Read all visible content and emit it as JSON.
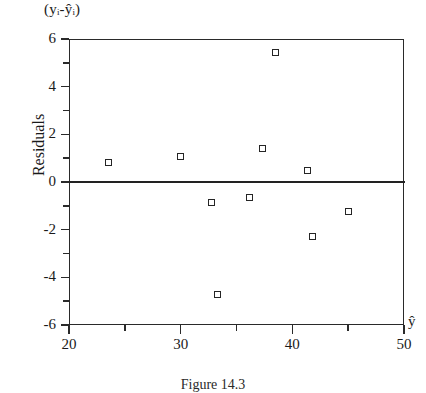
{
  "chart_data": {
    "type": "scatter",
    "title": "",
    "caption": "Figure 14.3",
    "ylabel": "Residuals",
    "y_axis_note": "(yᵢ-ŷᵢ)",
    "xlabel": "ŷ",
    "xlim": [
      20,
      50
    ],
    "ylim": [
      -6,
      6
    ],
    "grid": false,
    "legend": "none",
    "zero_reference_line": 0,
    "x_ticks_major": [
      20,
      30,
      40,
      50
    ],
    "x_ticks_minor": [
      25,
      35,
      45
    ],
    "y_ticks_major": [
      6,
      4,
      2,
      0,
      -2,
      -4,
      -6
    ],
    "y_ticks_minor": [
      5,
      3,
      1,
      -1,
      -3,
      -5
    ],
    "x_tick_labels": [
      "20",
      "30",
      "40",
      "50"
    ],
    "y_tick_labels": [
      "6",
      "4",
      "2",
      "0",
      "-2",
      "-4",
      "-6"
    ],
    "marker": "open-square",
    "points": [
      {
        "x": 23.5,
        "y": 0.8
      },
      {
        "x": 30.0,
        "y": 1.05
      },
      {
        "x": 32.8,
        "y": -0.85
      },
      {
        "x": 33.3,
        "y": -4.7
      },
      {
        "x": 36.2,
        "y": -0.65
      },
      {
        "x": 37.3,
        "y": 1.4
      },
      {
        "x": 38.5,
        "y": 5.45
      },
      {
        "x": 41.4,
        "y": 0.5
      },
      {
        "x": 41.8,
        "y": -2.3
      },
      {
        "x": 45.0,
        "y": -1.25
      }
    ],
    "x": [
      23.5,
      30.0,
      32.8,
      33.3,
      36.2,
      37.3,
      38.5,
      41.4,
      41.8,
      45.0
    ],
    "values": [
      0.8,
      1.05,
      -0.85,
      -4.7,
      -0.65,
      1.4,
      5.45,
      0.5,
      -2.3,
      -1.25
    ],
    "colors": {
      "axis": "#2a2a2a",
      "marker_edge": "#252525",
      "marker_fill": "#ffffff",
      "background": "#ffffff"
    }
  }
}
